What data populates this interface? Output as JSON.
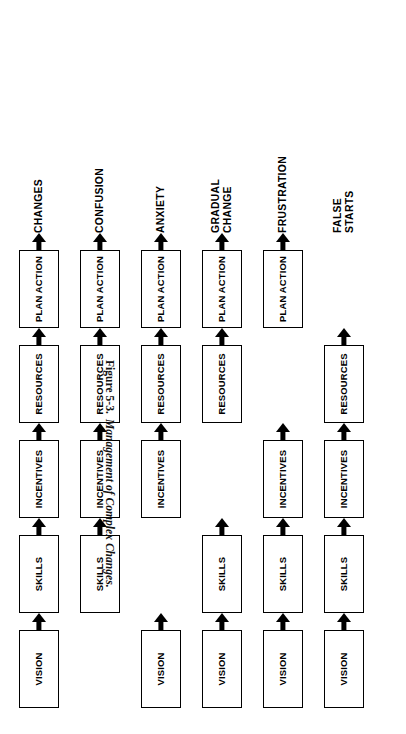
{
  "figure": {
    "number": "Figure 5-3.",
    "title": "Management of Complex Changes.",
    "columns": [
      "VISION",
      "SKILLS",
      "INCENTIVES",
      "RESOURCES",
      "PLAN ACTION",
      "OUTCOME"
    ],
    "node_labels": {
      "vision": "VISION",
      "skills": "SKILLS",
      "incentives": "INCENTIVES",
      "resources": "RESOURCES",
      "plan_action": "PLAN\nACTION"
    },
    "rows": [
      {
        "id": "row-complete",
        "missing": "",
        "outcome": "CHANGES",
        "cells": [
          {
            "label": "VISION",
            "present": true,
            "arrow_after": true
          },
          {
            "label": "SKILLS",
            "present": true,
            "arrow_after": true
          },
          {
            "label": "INCENTIVES",
            "present": true,
            "arrow_after": true
          },
          {
            "label": "RESOURCES",
            "present": true,
            "arrow_after": true
          },
          {
            "label": "PLAN\nACTION",
            "present": true,
            "arrow_after": true
          }
        ]
      },
      {
        "id": "row-no-vision",
        "missing": "VISION",
        "outcome": "CONFUSION",
        "cells": [
          {
            "label": "VISION",
            "present": false,
            "arrow_after": false
          },
          {
            "label": "SKILLS",
            "present": true,
            "arrow_after": true
          },
          {
            "label": "INCENTIVES",
            "present": true,
            "arrow_after": true
          },
          {
            "label": "RESOURCES",
            "present": true,
            "arrow_after": true
          },
          {
            "label": "PLAN\nACTION",
            "present": true,
            "arrow_after": true
          }
        ]
      },
      {
        "id": "row-no-skills",
        "missing": "SKILLS",
        "outcome": "ANXIETY",
        "cells": [
          {
            "label": "VISION",
            "present": true,
            "arrow_after": true
          },
          {
            "label": "SKILLS",
            "present": false,
            "arrow_after": false
          },
          {
            "label": "INCENTIVES",
            "present": true,
            "arrow_after": true
          },
          {
            "label": "RESOURCES",
            "present": true,
            "arrow_after": true
          },
          {
            "label": "PLAN\nACTION",
            "present": true,
            "arrow_after": true
          }
        ]
      },
      {
        "id": "row-no-incentives",
        "missing": "INCENTIVES",
        "outcome": "GRADUAL\nCHANGE",
        "cells": [
          {
            "label": "VISION",
            "present": true,
            "arrow_after": true
          },
          {
            "label": "SKILLS",
            "present": true,
            "arrow_after": true
          },
          {
            "label": "INCENTIVES",
            "present": false,
            "arrow_after": false
          },
          {
            "label": "RESOURCES",
            "present": true,
            "arrow_after": true
          },
          {
            "label": "PLAN\nACTION",
            "present": true,
            "arrow_after": true
          }
        ]
      },
      {
        "id": "row-no-resources",
        "missing": "RESOURCES",
        "outcome": "FRUSTRATION",
        "cells": [
          {
            "label": "VISION",
            "present": true,
            "arrow_after": true
          },
          {
            "label": "SKILLS",
            "present": true,
            "arrow_after": true
          },
          {
            "label": "INCENTIVES",
            "present": true,
            "arrow_after": true
          },
          {
            "label": "RESOURCES",
            "present": false,
            "arrow_after": false
          },
          {
            "label": "PLAN\nACTION",
            "present": true,
            "arrow_after": true
          }
        ]
      },
      {
        "id": "row-no-plan-action",
        "missing": "PLAN ACTION",
        "outcome": "FALSE\nSTARTS",
        "cells": [
          {
            "label": "VISION",
            "present": true,
            "arrow_after": true
          },
          {
            "label": "SKILLS",
            "present": true,
            "arrow_after": true
          },
          {
            "label": "INCENTIVES",
            "present": true,
            "arrow_after": true
          },
          {
            "label": "RESOURCES",
            "present": true,
            "arrow_after": true
          },
          {
            "label": "PLAN\nACTION",
            "present": false,
            "arrow_after": false
          }
        ]
      }
    ]
  }
}
